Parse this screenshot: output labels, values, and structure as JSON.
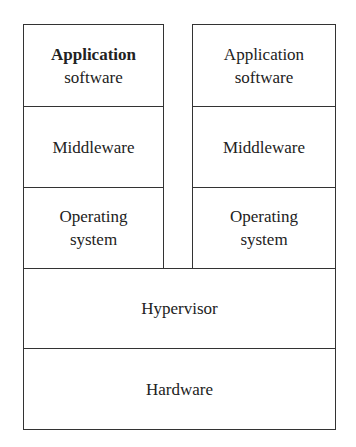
{
  "diagram": {
    "type": "layered virtualization stack",
    "left_stack": {
      "layers": [
        {
          "lines": [
            "Application",
            "software"
          ]
        },
        {
          "lines": [
            "Middleware"
          ]
        },
        {
          "lines": [
            "Operating",
            "system"
          ]
        }
      ]
    },
    "right_stack": {
      "layers": [
        {
          "lines": [
            "Application",
            "software"
          ]
        },
        {
          "lines": [
            "Middleware"
          ]
        },
        {
          "lines": [
            "Operating",
            "system"
          ]
        }
      ]
    },
    "shared_layers": [
      {
        "lines": [
          "Hypervisor"
        ]
      },
      {
        "lines": [
          "Hardware"
        ]
      }
    ],
    "colors": {
      "border": "#333333",
      "background": "#ffffff",
      "text": "#222222"
    }
  }
}
